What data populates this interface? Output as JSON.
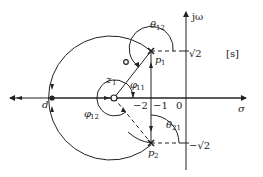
{
  "diagram": {
    "plane_label": "[s]",
    "axes": {
      "real_label": "σ",
      "imag_label": "jω"
    },
    "ticks": {
      "minus_two": "−2",
      "minus_one": "−1",
      "zero": "0",
      "root2": "√2",
      "minus_root2": "−√2"
    },
    "points": {
      "p1": "p",
      "p1_sub": "1",
      "p2": "p",
      "p2_sub": "2",
      "z1": "z",
      "z1_sub": "1",
      "d": "d"
    },
    "angles": {
      "theta12": "θ",
      "theta12_sub": "12",
      "theta21": "θ",
      "theta21_sub": "21",
      "phi11": "φ",
      "phi11_sub": "11",
      "phi12": "φ",
      "phi12_sub": "12"
    },
    "colors": {
      "line": "#222222",
      "background": "#ffffff"
    }
  }
}
